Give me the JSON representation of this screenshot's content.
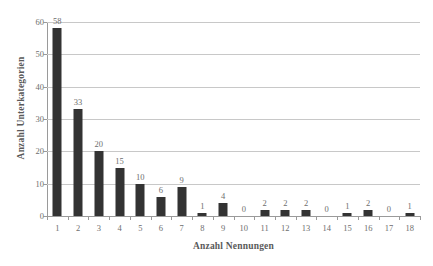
{
  "chart_data": {
    "type": "bar",
    "title": "",
    "xlabel": "Anzahl Nennungen",
    "ylabel": "Anzahl Unterkategorien",
    "categories": [
      "1",
      "2",
      "3",
      "4",
      "5",
      "6",
      "7",
      "8",
      "9",
      "10",
      "11",
      "12",
      "13",
      "14",
      "15",
      "16",
      "17",
      "18"
    ],
    "values": [
      58,
      33,
      20,
      15,
      10,
      6,
      9,
      1,
      4,
      0,
      2,
      2,
      2,
      0,
      1,
      2,
      0,
      1
    ],
    "data_labels": [
      "58",
      "33",
      "20",
      "15",
      "10",
      "6",
      "9",
      "1",
      "4",
      "0",
      "2",
      "2",
      "2",
      "0",
      "1",
      "2",
      "0",
      "1"
    ],
    "ylim": [
      0,
      60
    ],
    "yticks": [
      0,
      10,
      20,
      30,
      40,
      50,
      60
    ],
    "ytick_labels": [
      "0",
      "10",
      "20",
      "30",
      "40",
      "50",
      "60"
    ],
    "grid": true,
    "grid_axis": "y",
    "legend": false,
    "bar_color": "#333333",
    "gridline_color": "#c8c8c8",
    "axis_color": "#9a9a9a",
    "text_color": "#6e6e6e",
    "background": "#ffffff"
  }
}
